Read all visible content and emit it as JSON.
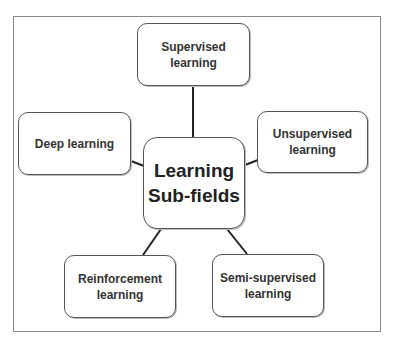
{
  "diagram": {
    "type": "hub-and-spoke",
    "center": {
      "label": "Learning\nSub-fields"
    },
    "nodes": [
      {
        "id": "supervised",
        "label": "Supervised\nlearning"
      },
      {
        "id": "deep",
        "label": "Deep learning"
      },
      {
        "id": "unsupervised",
        "label": "Unsupervised\nlearning"
      },
      {
        "id": "reinforcement",
        "label": "Reinforcement\nlearning"
      },
      {
        "id": "semi-supervised",
        "label": "Semi-supervised\nlearning"
      }
    ],
    "edges": [
      [
        "center",
        "supervised"
      ],
      [
        "center",
        "deep"
      ],
      [
        "center",
        "unsupervised"
      ],
      [
        "center",
        "reinforcement"
      ],
      [
        "center",
        "semi-supervised"
      ]
    ],
    "colors": {
      "border": "#555555",
      "frame": "#8a8a8a",
      "text": "#333333",
      "line": "#222222"
    }
  }
}
